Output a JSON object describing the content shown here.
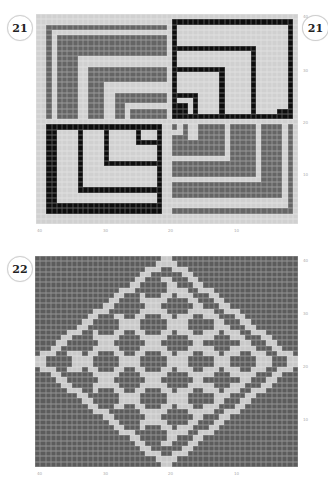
{
  "patterns": [
    {
      "id": "21",
      "badge_left": "21",
      "badge_right": "21",
      "cols": 50,
      "rows": 40,
      "x_ticks": [
        "40",
        "30",
        "20",
        "10"
      ],
      "y_ticks": [
        "40",
        "30",
        "20",
        "10"
      ],
      "colors": {
        "light": "#d0d0d0",
        "grey": "#656565",
        "black": "#0d0d0d"
      }
    },
    {
      "id": "22",
      "badge_left": "22",
      "cols": 50,
      "rows": 40,
      "x_ticks": [
        "40",
        "30",
        "20",
        "10"
      ],
      "y_ticks": [
        "40",
        "30",
        "20",
        "10"
      ],
      "colors": {
        "background": "#5c5c5c",
        "motif": "#c9c9c9"
      }
    }
  ]
}
